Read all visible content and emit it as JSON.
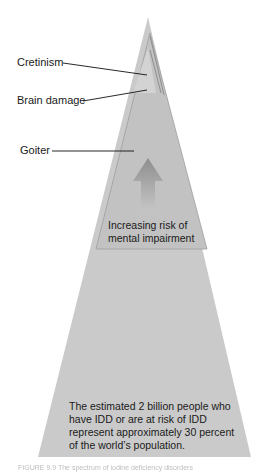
{
  "diagram": {
    "type": "pyramid",
    "labels": [
      {
        "id": "cretinism",
        "text": "Cretinism"
      },
      {
        "id": "brain_damage",
        "text": "Brain damage"
      },
      {
        "id": "goiter",
        "text": "Goiter"
      }
    ],
    "arrow_label": "Increasing risk of mental impairment",
    "arrow_label_lines": [
      "Increasing risk of",
      "mental impairment"
    ],
    "base_text_lines": [
      "The estimated 2 billion people who",
      "have IDD or are at risk of IDD",
      "represent approximately 30 percent",
      "of the world’s population."
    ],
    "caption": "FIGURE 9.9  The spectrum of iodine deficiency disorders",
    "colors": {
      "pyramid_fill": "#c9c9c9",
      "inner_fill": "#bdbdbd",
      "apex_fill": "#d6d6d6",
      "arrow": "#9a9a9a",
      "leader_line": "#111111"
    }
  }
}
